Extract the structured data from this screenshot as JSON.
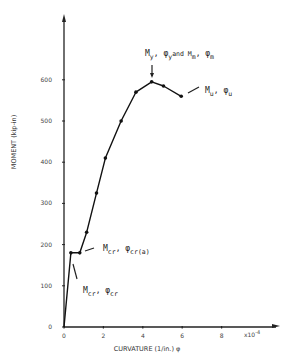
{
  "chart_data": {
    "type": "line",
    "title": "",
    "xlabel": "CURVATURE (1/in.) φ",
    "ylabel": "MOMENT (kip-in)",
    "x_multiplier_label": "x10",
    "x_multiplier_exp": "-4",
    "xlim": [
      0,
      10.5
    ],
    "ylim": [
      0,
      700
    ],
    "xticks": [
      0,
      2,
      4,
      6,
      8
    ],
    "xtick_labels": [
      "0",
      "2",
      "4",
      "6",
      "8"
    ],
    "yticks": [
      0,
      100,
      200,
      300,
      400,
      500,
      600
    ],
    "ytick_labels": [
      "0",
      "100",
      "200",
      "300",
      "400",
      "500",
      "600"
    ],
    "grid": false,
    "legend": null,
    "series": [
      {
        "name": "Moment-curvature",
        "x": [
          0,
          0.35,
          0.8,
          1.15,
          1.65,
          2.1,
          2.9,
          3.65,
          4.45,
          5.05,
          5.95
        ],
        "y": [
          0,
          180,
          180,
          230,
          325,
          410,
          500,
          570,
          595,
          585,
          560
        ],
        "markers": [
          false,
          true,
          true,
          true,
          true,
          true,
          true,
          true,
          true,
          true,
          true
        ]
      }
    ],
    "annotations": [
      {
        "id": "mcr",
        "parts": [
          [
            "M",
            "cr"
          ],
          [
            ", φ",
            "cr"
          ]
        ],
        "point": [
          0.35,
          180
        ]
      },
      {
        "id": "mcr-a",
        "parts": [
          [
            "M",
            "cr"
          ],
          [
            ", φ",
            "cr(a)"
          ]
        ],
        "point": [
          0.8,
          180
        ]
      },
      {
        "id": "my-mm",
        "parts": [
          [
            "M",
            "y"
          ],
          [
            ", φ",
            "y"
          ],
          [
            "and M",
            "m"
          ],
          [
            ", φ",
            "m"
          ]
        ],
        "point": [
          4.45,
          595
        ]
      },
      {
        "id": "mu",
        "parts": [
          [
            "M",
            "u"
          ],
          [
            ", φ",
            "u"
          ]
        ],
        "point": [
          5.95,
          560
        ]
      }
    ]
  },
  "text": {
    "ylabel": "MOMENT (kip-in)",
    "xlabel": "CURVATURE (1/in.) φ",
    "ann_mcr_m": "M",
    "ann_mcr_m_sub": "cr",
    "ann_mcr_phi": ",  φ",
    "ann_mcr_phi_sub": "cr",
    "ann_mcra_m": "M",
    "ann_mcra_m_sub": "cr",
    "ann_mcra_phi": ", φ",
    "ann_mcra_phi_sub": "cr(a)",
    "ann_my_m": "M",
    "ann_my_m_sub": "y",
    "ann_my_phi": ", φ",
    "ann_my_phi_sub": "y",
    "ann_my_and": "and M",
    "ann_my_mm_sub": "m",
    "ann_my_phim": ", φ",
    "ann_my_phim_sub": "m",
    "ann_mu_m": "M",
    "ann_mu_m_sub": "u",
    "ann_mu_phi": ", φ",
    "ann_mu_phi_sub": "u",
    "xmult": "x10",
    "xmult_exp": "-4"
  }
}
